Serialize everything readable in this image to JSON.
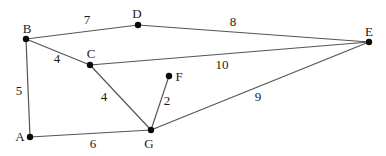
{
  "diagram": {
    "type": "undirected-weighted-graph",
    "canvas": {
      "width": 386,
      "height": 156,
      "background": "#ffffff"
    },
    "style": {
      "edge_color": "#555555",
      "edge_width": 1.2,
      "node_color": "#0a0a0a",
      "node_radius": 3.2,
      "text_color": "#1a1a1a",
      "node_font_size": 13,
      "weight_font_size": 13
    },
    "nodes": [
      {
        "id": "A",
        "x": 30,
        "y": 137,
        "label": "A",
        "label_x": 20,
        "label_y": 141
      },
      {
        "id": "B",
        "x": 26,
        "y": 39,
        "label": "B",
        "label_x": 27,
        "label_y": 33
      },
      {
        "id": "C",
        "x": 90,
        "y": 65,
        "label": "C",
        "label_x": 91,
        "label_y": 58
      },
      {
        "id": "D",
        "x": 138,
        "y": 25,
        "label": "D",
        "label_x": 137,
        "label_y": 18
      },
      {
        "id": "E",
        "x": 369,
        "y": 42,
        "label": "E",
        "label_x": 369,
        "label_y": 36
      },
      {
        "id": "F",
        "x": 169,
        "y": 76,
        "label": "F",
        "label_x": 179,
        "label_y": 81
      },
      {
        "id": "G",
        "x": 151,
        "y": 130,
        "label": "G",
        "label_x": 149,
        "label_y": 148
      }
    ],
    "edges": [
      {
        "from": "B",
        "to": "D",
        "weight": "7",
        "label_x": 87,
        "label_y": 24
      },
      {
        "from": "D",
        "to": "E",
        "weight": "8",
        "label_x": 233,
        "label_y": 26
      },
      {
        "from": "B",
        "to": "C",
        "weight": "4",
        "label_x": 57,
        "label_y": 63
      },
      {
        "from": "C",
        "to": "E",
        "weight": "10",
        "label_x": 222,
        "label_y": 69
      },
      {
        "from": "A",
        "to": "B",
        "weight": "5",
        "label_x": 19,
        "label_y": 95
      },
      {
        "from": "C",
        "to": "G",
        "weight": "4",
        "label_x": 104,
        "label_y": 101
      },
      {
        "from": "F",
        "to": "G",
        "weight": "2",
        "label_x": 167,
        "label_y": 105
      },
      {
        "from": "G",
        "to": "E",
        "weight": "9",
        "label_x": 258,
        "label_y": 101
      },
      {
        "from": "A",
        "to": "G",
        "weight": "6",
        "label_x": 93,
        "label_y": 148
      }
    ]
  }
}
